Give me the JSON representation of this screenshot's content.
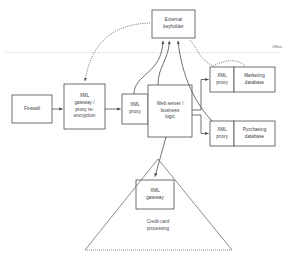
{
  "diagram": {
    "background_color": "#ffffff",
    "stroke_color": "#4d4d4d",
    "text_color": "#3a3a3a",
    "boundary": {
      "offline_label": "Offline"
    },
    "nodes": {
      "external_keyholder": {
        "label": "External\nkeyholder",
        "line1": "External",
        "line2": "keyholder"
      },
      "firewall": {
        "label": "Firewall"
      },
      "xml_gateway_reencryption": {
        "line1": "XML",
        "line2": "gateway /",
        "line3": "proxy re-",
        "line4": "encryption"
      },
      "xml_proxy_main": {
        "line1": "XML",
        "line2": "proxy"
      },
      "web_server": {
        "line1": "Web server /",
        "line2": "business",
        "line3": "logic"
      },
      "xml_proxy_marketing": {
        "line1": "XML",
        "line2": "proxy"
      },
      "marketing_database": {
        "line1": "Marketing",
        "line2": "database"
      },
      "xml_proxy_purchasing": {
        "line1": "XML",
        "line2": "proxy"
      },
      "purchasing_database": {
        "line1": "Purchasing",
        "line2": "database"
      },
      "xml_gateway_creditcard": {
        "line1": "XML",
        "line2": "gateway"
      }
    },
    "zones": {
      "credit_card": {
        "line1": "Credit card",
        "line2": "processing"
      }
    }
  }
}
